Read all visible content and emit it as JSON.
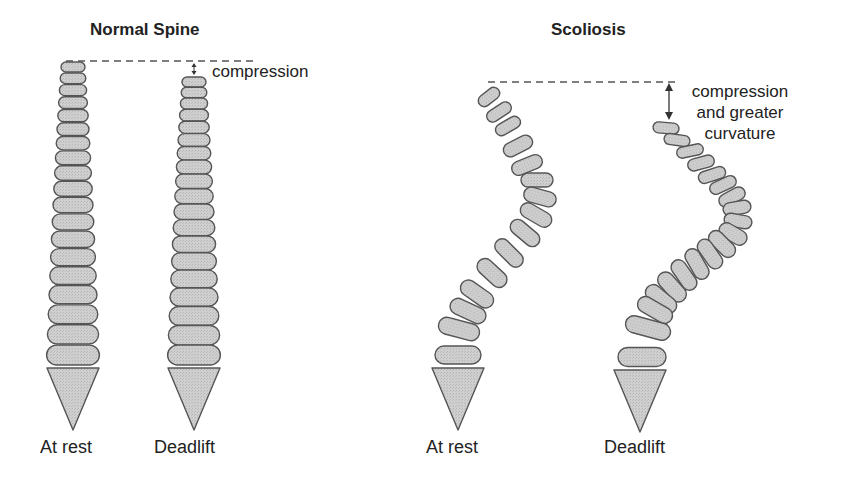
{
  "panels": [
    {
      "title": "Normal Spine",
      "columns": [
        {
          "label": "At rest",
          "cx": 73,
          "top": 62,
          "count": 19
        },
        {
          "label": "Deadlift",
          "cx": 194,
          "top": 77,
          "count": 19
        }
      ],
      "annotation": "compression"
    },
    {
      "title": "Scoliosis",
      "columns": [
        {
          "label": "At rest"
        },
        {
          "label": "Deadlift"
        }
      ],
      "annotation": [
        "compression",
        "and greater",
        "curvature"
      ]
    }
  ],
  "colors": {
    "vertebra_fill": "#c8c8c8",
    "vertebra_stroke": "#555555",
    "dashed_line": "#555555",
    "text": "#222222"
  }
}
